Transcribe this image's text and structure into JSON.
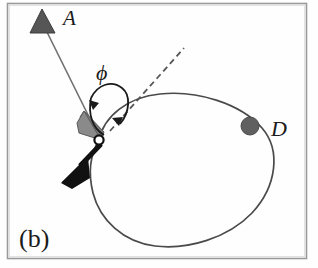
{
  "figure": {
    "panel_label": "(b)",
    "frame_color": "#8d8d8d",
    "background_color": "#fefefe",
    "curve_color": "#4a4a4a",
    "labels": {
      "source_marker": "A",
      "detector_marker": "D",
      "angle": "ϕ"
    },
    "markers": {
      "source": {
        "name": "triangle-marker-a",
        "shape": "triangle",
        "color": "#5a5a5a",
        "x": 42,
        "y": 22
      },
      "detector": {
        "name": "circle-marker-d",
        "shape": "filled-circle",
        "color": "#5f5f5f",
        "x": 250,
        "y": 126,
        "r": 9
      },
      "scatter_point": {
        "name": "open-circle-scatter-point",
        "shape": "open-circle",
        "fill": "#ffffff",
        "stroke": "#101010",
        "x": 99,
        "y": 140,
        "r": 4
      }
    },
    "arrows": {
      "incident": {
        "name": "incident-ray-arrow",
        "color": "#6b6b6b",
        "from_x": 44,
        "from_y": 26,
        "to_x": 98,
        "to_y": 136
      },
      "scattered": {
        "name": "scattered-ray-arrow",
        "color": "#111111",
        "from_x": 101,
        "from_y": 144,
        "to_x": 68,
        "to_y": 178
      }
    },
    "dashed_line": {
      "name": "reference-dashed-line",
      "color": "#555555",
      "from_x": 110,
      "from_y": 131,
      "to_x": 184,
      "to_y": 48
    },
    "angle_arc": {
      "name": "phi-angle-arc",
      "color": "#1a1a1a",
      "label_x": 104,
      "label_y": 71
    },
    "label_positions": {
      "a_x": 63,
      "a_y": 22,
      "d_x": 271,
      "d_y": 134,
      "panel_x": 20,
      "panel_y": 243
    }
  }
}
